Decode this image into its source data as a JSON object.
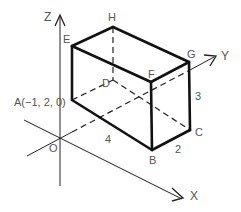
{
  "diagram": {
    "type": "cuboid-3d-coordinate",
    "axes": {
      "z_label": "Z",
      "y_label": "Y",
      "x_label": "X",
      "origin_label": "O"
    },
    "vertices": {
      "A": "A(−1, 2, 0)",
      "B": "B",
      "C": "C",
      "D": "D",
      "E": "E",
      "F": "F",
      "G": "G",
      "H": "H"
    },
    "dimensions": {
      "AB": "4",
      "BC": "2",
      "CG": "3"
    },
    "colors": {
      "edge": "#111111",
      "label": "#555555",
      "background": "#ffffff"
    }
  }
}
